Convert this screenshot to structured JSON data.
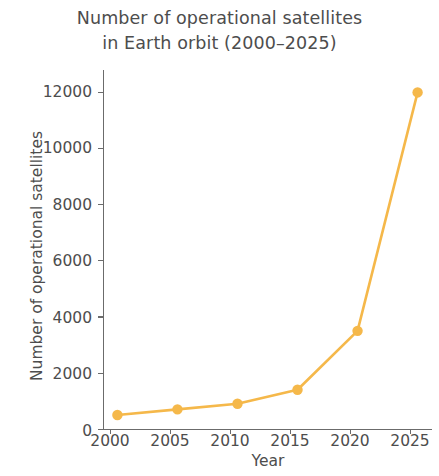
{
  "chart_data": {
    "type": "line",
    "title": "Number of operational satellites\nin Earth orbit (2000–2025)",
    "title_line1": "Number of operational satellites",
    "title_line2": "in Earth orbit (2000–2025)",
    "xlabel": "Year",
    "ylabel": "Number of operational satellites",
    "x": [
      2000,
      2005,
      2010,
      2015,
      2020,
      2025
    ],
    "values": [
      500,
      700,
      900,
      1400,
      3500,
      12000
    ],
    "series": [
      {
        "name": "Operational satellites",
        "values": [
          500,
          700,
          900,
          1400,
          3500,
          12000
        ]
      }
    ],
    "xtick_labels": [
      "2000",
      "2005",
      "2010",
      "2015",
      "2020",
      "2025"
    ],
    "ytick_labels": [
      "0",
      "2000",
      "4000",
      "6000",
      "8000",
      "10000",
      "12000"
    ],
    "ytick_values": [
      0,
      2000,
      4000,
      6000,
      8000,
      10000,
      12000
    ],
    "xlim": [
      1998.8,
      2026.2
    ],
    "ylim": [
      0,
      12800
    ],
    "grid": false,
    "legend": false,
    "marker": "circle",
    "line_color": "#F5B84A",
    "marker_color": "#F5B84A",
    "axis_color": "#6b6b6b",
    "text_color": "#4d4d4d",
    "background_color": "#ffffff"
  }
}
